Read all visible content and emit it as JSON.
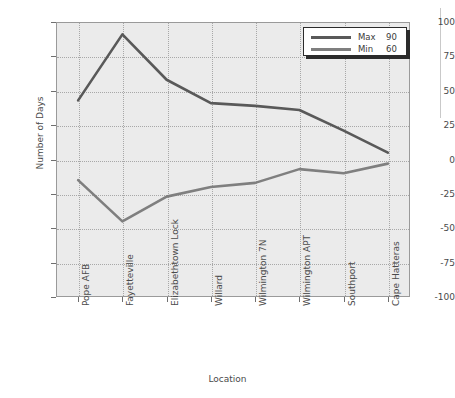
{
  "chart_data": {
    "type": "line",
    "title": "",
    "xlabel": "Location",
    "ylabel": "Number of Days",
    "categories": [
      "Pope AFB",
      "Fayetteville",
      "Elizabethtown Lock",
      "Willard",
      "Wilmington 7N",
      "Wilmington APT",
      "Southport",
      "Cape Hatteras"
    ],
    "series": [
      {
        "name": "Max",
        "legend_value": "90",
        "color": "#595959",
        "values": [
          43,
          91,
          58,
          41,
          39,
          36,
          21,
          5
        ]
      },
      {
        "name": "Min",
        "legend_value": "60",
        "color": "#7f7f7f",
        "values": [
          -15,
          -45,
          -27,
          -20,
          -17,
          -7,
          -10,
          -3
        ]
      }
    ],
    "ylim": [
      -100,
      100
    ],
    "yticks": [
      100,
      75,
      50,
      25,
      0,
      -25,
      -50,
      -75,
      -100
    ],
    "ytick_labels": [
      "100",
      "75",
      "50",
      "25",
      "0",
      "-25",
      "-50",
      "-75",
      "-100"
    ],
    "grid": true,
    "legend_position": "top-right",
    "plot_background": "#ebebeb",
    "grid_color": "#a8a8a8",
    "axis_color": "#9a9a9a"
  },
  "legend": {
    "rows": [
      {
        "name": "Max",
        "value": "90"
      },
      {
        "name": "Min",
        "value": "60"
      }
    ]
  },
  "axes": {
    "y_title": "Number of Days",
    "x_title": "Location"
  }
}
